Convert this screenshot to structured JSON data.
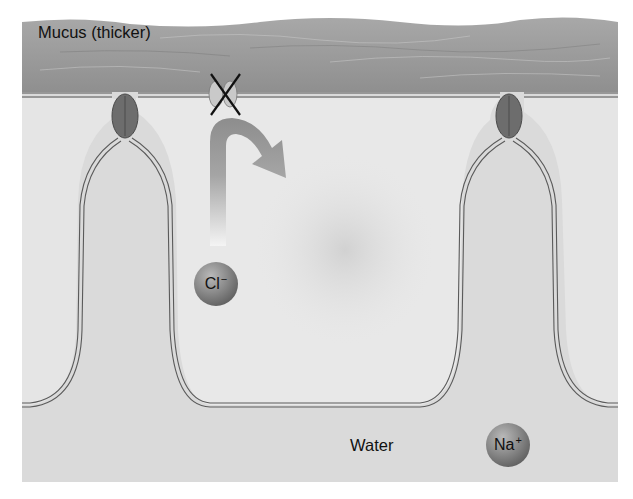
{
  "diagram": {
    "title": "",
    "labels": {
      "mucus": "Mucus (thicker)",
      "water": "Water"
    },
    "ions": {
      "chloride": {
        "symbol": "Cl",
        "charge": "−"
      },
      "sodium": {
        "symbol": "Na",
        "charge": "+"
      }
    },
    "components": [
      "mucus-layer",
      "apical-membrane",
      "tight-junction-left",
      "tight-junction-right",
      "blocked-chloride-channel",
      "curved-arrow",
      "epithelial-cell-left",
      "epithelial-cell-center",
      "epithelial-cell-right"
    ],
    "colors": {
      "background": "#ffffff",
      "mucus": "#9a9a9a",
      "cell_fill": "#e6e6e6",
      "extracellular": "#d9d9d9",
      "membrane": "#555555",
      "junction": "#6e6e6e",
      "arrow": "#8f8f8f",
      "block_x": "#111111"
    }
  }
}
